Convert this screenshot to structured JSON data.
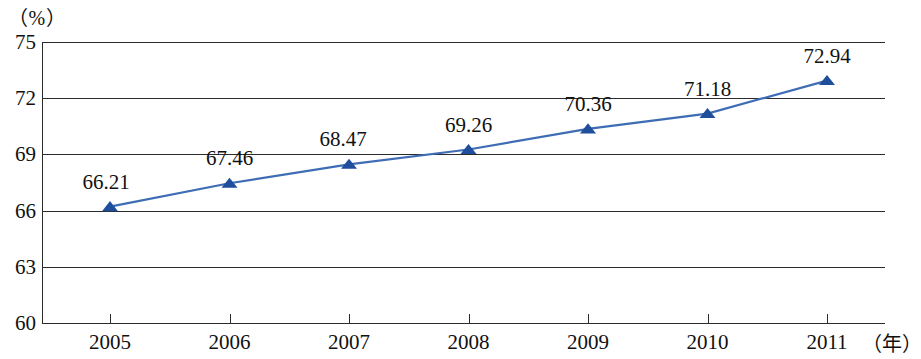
{
  "chart_data": {
    "type": "line",
    "title": "",
    "xlabel": "（年）",
    "ylabel": "（%）",
    "categories": [
      "2005",
      "2006",
      "2007",
      "2008",
      "2009",
      "2010",
      "2011"
    ],
    "values": [
      66.21,
      67.46,
      68.47,
      69.26,
      70.36,
      71.18,
      72.94
    ],
    "point_labels": [
      "66.21",
      "67.46",
      "68.47",
      "69.26",
      "70.36",
      "71.18",
      "72.94"
    ],
    "ylim": [
      60,
      75
    ],
    "ytick_labels": [
      "75",
      "72",
      "69",
      "66",
      "63",
      "60"
    ],
    "ytick_values": [
      75,
      72,
      69,
      66,
      63,
      60
    ],
    "grid": "horizontal",
    "legend": "none",
    "series": [
      {
        "name": "",
        "values": [
          66.21,
          67.46,
          68.47,
          69.26,
          70.36,
          71.18,
          72.94
        ],
        "marker": "triangle",
        "line_color": "#3E6DB5",
        "marker_color": "#1F4E9C"
      }
    ],
    "axis_color": "#2b2b2b"
  }
}
